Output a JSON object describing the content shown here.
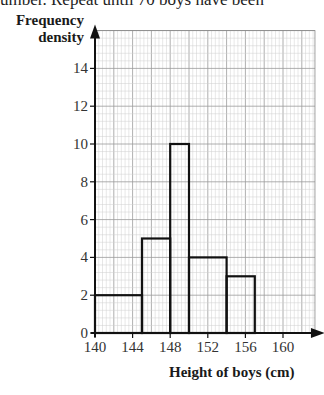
{
  "header_text": "umber. Repeat until 70 boys have been",
  "chart_data": {
    "type": "bar",
    "title": "",
    "xlabel": "Height of boys (cm)",
    "ylabel": "Frequency density",
    "bins": [
      {
        "from": 140,
        "to": 145,
        "value": 2
      },
      {
        "from": 145,
        "to": 148,
        "value": 5
      },
      {
        "from": 148,
        "to": 150,
        "value": 10
      },
      {
        "from": 150,
        "to": 154,
        "value": 4
      },
      {
        "from": 154,
        "to": 157,
        "value": 3
      }
    ],
    "categories": [
      "140-145",
      "145-148",
      "148-150",
      "150-154",
      "154-157"
    ],
    "values": [
      2,
      5,
      10,
      4,
      3
    ],
    "xticks": [
      140,
      144,
      148,
      152,
      156,
      160
    ],
    "yticks": [
      0,
      2,
      4,
      6,
      8,
      10,
      12,
      14
    ],
    "xlim": [
      140,
      163.4
    ],
    "ylim": [
      0,
      16
    ],
    "grid": true,
    "legend": null
  },
  "labels": {
    "ylabel_line1": "Frequency",
    "ylabel_line2": "density",
    "xlabel": "Height of boys (cm)"
  }
}
